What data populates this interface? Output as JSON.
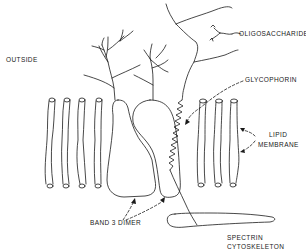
{
  "labels": {
    "outside": "OUTSIDE",
    "oligosaccharides": "OLIGOSACCHARIDES",
    "glycophorin": "GLYCOPHORIN",
    "lipid": "LIPID",
    "membrane": "MEMBRANE",
    "band3_dimer": "BAND 3 DIMER",
    "spectrin": "SPECTRIN",
    "cytoskeleton": "CYTOSKELETON"
  },
  "components": [
    {
      "name": "lipid-bilayer-left",
      "count": 4
    },
    {
      "name": "band-3-dimer",
      "count": 2
    },
    {
      "name": "glycophorin",
      "count": 1
    },
    {
      "name": "lipid-bilayer-right",
      "count": 3
    },
    {
      "name": "spectrin-cytoskeleton",
      "count": 1
    }
  ],
  "colors": {
    "line": "#1a1a1a",
    "background": "#ffffff"
  }
}
